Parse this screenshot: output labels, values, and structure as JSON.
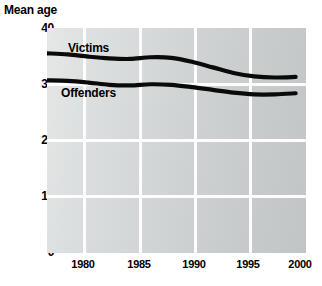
{
  "chart_data": {
    "type": "line",
    "title": "",
    "ylabel": "Mean age",
    "xlabel": "",
    "ylim": [
      0,
      40
    ],
    "yticks": [
      0,
      10,
      20,
      30,
      40
    ],
    "ytick_labels": [
      "0",
      "10",
      "20",
      "30",
      "40"
    ],
    "xlim": [
      1976,
      2001
    ],
    "xticks": [
      1980,
      1985,
      1990,
      1995,
      2000
    ],
    "xtick_labels": [
      "1980",
      "1985",
      "1990",
      "1995",
      "2000"
    ],
    "grid": true,
    "legend": "inline-labels",
    "x": [
      1976,
      1978,
      1980,
      1982,
      1984,
      1986,
      1988,
      1990,
      1992,
      1994,
      1996,
      1998,
      2000
    ],
    "series": [
      {
        "name": "Victims",
        "values": [
          35.5,
          35.3,
          34.9,
          34.6,
          34.5,
          34.8,
          34.7,
          34.0,
          33.0,
          32.0,
          31.4,
          31.2,
          31.3
        ]
      },
      {
        "name": "Offenders",
        "values": [
          30.7,
          30.6,
          30.3,
          29.9,
          29.8,
          30.0,
          29.9,
          29.5,
          29.0,
          28.5,
          28.2,
          28.2,
          28.4
        ]
      }
    ],
    "annotations": [
      {
        "text": "Victims",
        "x": 1980,
        "y": 36.8
      },
      {
        "text": "Offenders",
        "x": 1979.4,
        "y": 28.9
      }
    ],
    "colors": {
      "line": "#0a0a0a",
      "grid": "#fdfdfd",
      "plot_background_left": "#e6e8e8",
      "plot_background_right": "#c2c5c5",
      "text": "#000000",
      "page_background": "#ffffff"
    }
  }
}
